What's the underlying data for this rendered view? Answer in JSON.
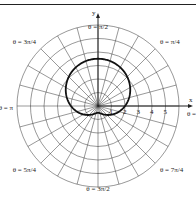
{
  "chart_data": {
    "type": "line",
    "coordinate_system": "polar",
    "title": "",
    "curve": {
      "description": "Closed limaçon-like curve, larger above the x-axis and flattened below. No equation is printed on the figure.",
      "equation_shown": false,
      "measured_points": [
        {
          "theta": "0",
          "r": 2
        },
        {
          "theta": "π/2",
          "r": 3.8
        },
        {
          "theta": "π",
          "r": 2
        },
        {
          "theta": "3π/2",
          "r": 0.9
        }
      ],
      "fitted_approximation": {
        "note": "Inferred from measured points for rendering only; not shown in the image. Slightly underestimates r near θ=3π/2.",
        "form": "r = a + b·sin(θ)",
        "a": 2,
        "b": 1.5
      }
    },
    "radial_ticks": [
      "1",
      "2",
      "3",
      "4",
      "5"
    ],
    "radial_max": 6,
    "grid": {
      "circles": [
        1,
        2,
        3,
        4,
        5,
        6
      ],
      "radial_lines_every_deg": 15
    },
    "axis_labels": {
      "x": "x",
      "y": "y"
    },
    "angle_labels": [
      {
        "id": "zero",
        "text": "θ = 0"
      },
      {
        "id": "pi4",
        "text": "θ = π/4"
      },
      {
        "id": "pi2",
        "text": "θ = π/2"
      },
      {
        "id": "3pi4",
        "text": "θ = 3π/4"
      },
      {
        "id": "pi",
        "text": "θ = π"
      },
      {
        "id": "5pi4",
        "text": "θ = 5π/4"
      },
      {
        "id": "3pi2",
        "text": "θ = 3π/2"
      },
      {
        "id": "7pi4",
        "text": "θ = 7π/4"
      }
    ],
    "colors": {
      "grid": "#333333",
      "curve": "#111111",
      "text": "#222222"
    }
  }
}
